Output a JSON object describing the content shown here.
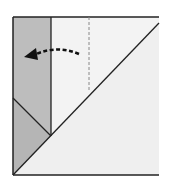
{
  "diagram": {
    "type": "origami-fold-step",
    "colors": {
      "background": "#ffffff",
      "paper_light": "#efefef",
      "paper_shaded": "#bdbdbd",
      "line": "#222222",
      "arrow": "#111111",
      "dashed": "#888888"
    }
  }
}
